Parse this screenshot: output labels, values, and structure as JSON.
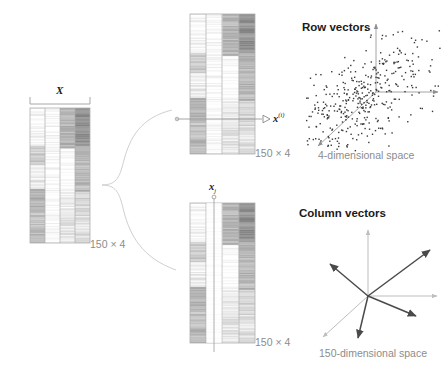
{
  "figure": {
    "type": "diagram",
    "topic": "Matrix X viewed as row vectors and column vectors",
    "caption": ""
  },
  "matrices": {
    "main": {
      "label": "X",
      "dim_label": "150 × 4",
      "rows": 150,
      "cols": 4,
      "bracket": true
    },
    "rows_view": {
      "dim_label": "150 × 4",
      "highlight": "row",
      "vector_label": "x",
      "vector_sup": "(i)",
      "marker": "arrowhead-right"
    },
    "cols_view": {
      "dim_label": "150 × 4",
      "highlight": "column",
      "vector_label": "x",
      "vector_sub": "j",
      "marker": "circle-top"
    }
  },
  "panels": [
    {
      "id": "row-vectors",
      "title": "Row vectors",
      "space_label": "4-dimensional space",
      "plot_type": "scatter",
      "axes": [
        "up",
        "right",
        "down-left-diagonal"
      ]
    },
    {
      "id": "column-vectors",
      "title": "Column vectors",
      "space_label": "150-dimensional space",
      "plot_type": "vector-field",
      "axes": [
        "up",
        "right",
        "down-left-diagonal"
      ],
      "vector_count": 4
    }
  ],
  "chart_data": {
    "type": "scatter",
    "title": "Row vectors",
    "xlabel": "",
    "ylabel": "",
    "space": "4-dimensional space",
    "n_points": 420,
    "correlation": 0.55,
    "note": "Point cloud of 150 observations projected into a pseudo-3D axis frame",
    "column_vectors": [
      {
        "name": "v1",
        "dx": 62,
        "dy": -46
      },
      {
        "name": "v2",
        "dx": -38,
        "dy": -32
      },
      {
        "name": "v3",
        "dx": 48,
        "dy": 20
      },
      {
        "name": "v4",
        "dx": -10,
        "dy": 42
      }
    ]
  },
  "colors": {
    "ink": "#1a1a1a",
    "muted": "#8c8c8c",
    "axis": "#9a9a9a",
    "vector": "#4a4a4a",
    "line": "#b8b8b8",
    "brace": "#cccccc",
    "matrix_border": "#b0b0b0"
  }
}
